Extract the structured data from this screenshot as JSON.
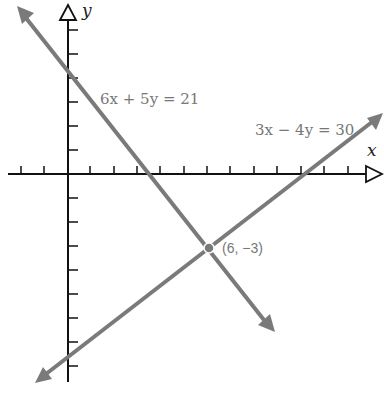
{
  "figure": {
    "axes": {
      "x_label": "x",
      "y_label": "y"
    },
    "lines": [
      {
        "equation": "6x + 5y = 21",
        "color": "#7a7a7a"
      },
      {
        "equation": "3x − 4y = 30",
        "color": "#7a7a7a"
      }
    ],
    "intersection": {
      "label": "(6, −3)",
      "x": 6,
      "y": -3
    }
  }
}
